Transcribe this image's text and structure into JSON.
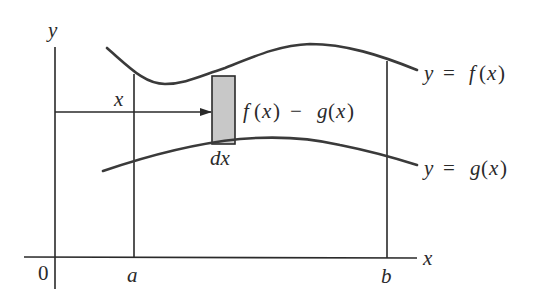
{
  "figure": {
    "type": "area-between-curves",
    "labels": {
      "y_axis": "y",
      "x_axis": "x",
      "origin": "0",
      "a": "a",
      "b": "b",
      "x_position": "x",
      "dx": "dx",
      "height_expr_f": "f",
      "height_expr_paren1": "(",
      "height_expr_x1": "x",
      "height_expr_paren2": ")",
      "height_expr_minus": "−",
      "height_expr_g": "g",
      "height_expr_paren3": "(",
      "height_expr_x2": "x",
      "height_expr_paren4": ")",
      "upper_curve_y": "y",
      "upper_curve_eq": "=",
      "upper_curve_f": "f",
      "upper_curve_open": "(",
      "upper_curve_x": "x",
      "upper_curve_close": ")",
      "lower_curve_y": "y",
      "lower_curve_eq": "=",
      "lower_curve_g": "g",
      "lower_curve_open": "(",
      "lower_curve_x": "x",
      "lower_curve_close": ")"
    },
    "curves": [
      {
        "name": "upper",
        "equation": "y = f(x)"
      },
      {
        "name": "lower",
        "equation": "y = g(x)"
      }
    ],
    "strip": {
      "fill": "#c8c8c8",
      "label_height": "f(x) − g(x)",
      "label_width": "dx"
    },
    "colors": {
      "stroke": "#2a2a2a",
      "strip_fill": "#c8c8c8",
      "background": "#ffffff"
    }
  }
}
